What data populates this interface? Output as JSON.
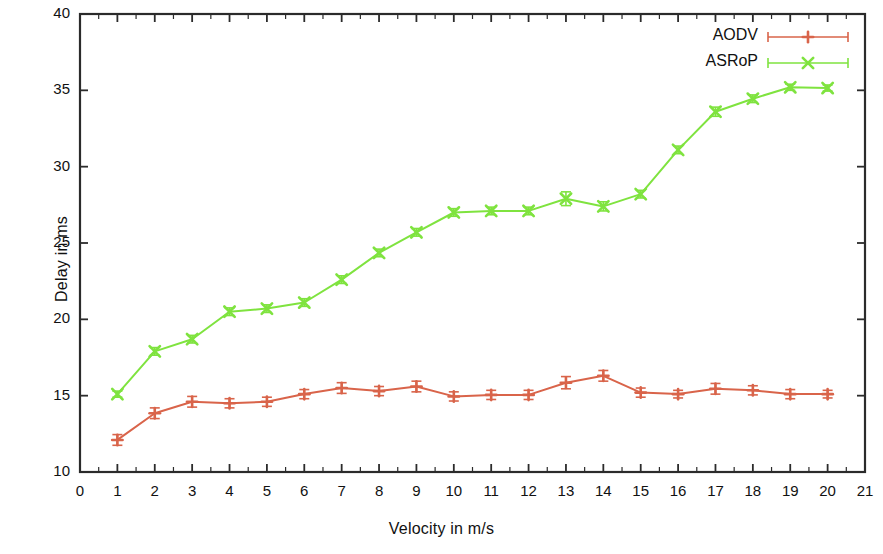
{
  "chart_data": {
    "type": "line",
    "title": "",
    "xlabel": "Velocity in m/s",
    "ylabel": "Delay in ms",
    "xlim": [
      0,
      21
    ],
    "ylim": [
      10,
      40
    ],
    "xticks": [
      0,
      1,
      2,
      3,
      4,
      5,
      6,
      7,
      8,
      9,
      10,
      11,
      12,
      13,
      14,
      15,
      16,
      17,
      18,
      19,
      20,
      21
    ],
    "yticks": [
      10,
      15,
      20,
      25,
      30,
      35,
      40
    ],
    "grid": false,
    "legend_position": "top-right",
    "x": [
      1,
      2,
      3,
      4,
      5,
      6,
      7,
      8,
      9,
      10,
      11,
      12,
      13,
      14,
      15,
      16,
      17,
      18,
      19,
      20
    ],
    "series": [
      {
        "name": "AODV",
        "color": "#d9644a",
        "marker": "plus",
        "values": [
          12.1,
          13.85,
          14.6,
          14.5,
          14.6,
          15.1,
          15.5,
          15.3,
          15.6,
          14.95,
          15.05,
          15.05,
          15.85,
          16.3,
          15.2,
          15.1,
          15.45,
          15.35,
          15.1,
          15.1
        ],
        "errors": [
          0.35,
          0.35,
          0.35,
          0.3,
          0.3,
          0.3,
          0.35,
          0.3,
          0.35,
          0.3,
          0.3,
          0.3,
          0.4,
          0.35,
          0.3,
          0.25,
          0.35,
          0.3,
          0.3,
          0.25
        ]
      },
      {
        "name": "ASRoP",
        "color": "#7fe33f",
        "marker": "cross",
        "values": [
          15.1,
          17.9,
          18.7,
          20.5,
          20.7,
          21.1,
          22.6,
          24.35,
          25.7,
          27.0,
          27.1,
          27.1,
          27.9,
          27.4,
          28.2,
          31.1,
          33.6,
          34.45,
          35.2,
          35.15
        ],
        "errors": [
          0.2,
          0.25,
          0.25,
          0.25,
          0.25,
          0.25,
          0.25,
          0.25,
          0.25,
          0.25,
          0.25,
          0.25,
          0.45,
          0.3,
          0.25,
          0.25,
          0.3,
          0.25,
          0.2,
          0.2
        ]
      }
    ]
  },
  "axes": {
    "x_title": "Velocity in m/s",
    "y_title": "Delay in ms",
    "x_tick_labels": [
      "0",
      "1",
      "2",
      "3",
      "4",
      "5",
      "6",
      "7",
      "8",
      "9",
      "10",
      "11",
      "12",
      "13",
      "14",
      "15",
      "16",
      "17",
      "18",
      "19",
      "20",
      "21"
    ],
    "y_tick_labels": [
      "10",
      "15",
      "20",
      "25",
      "30",
      "35",
      "40"
    ]
  },
  "legend": {
    "entries": [
      {
        "label": "AODV",
        "color": "#d9644a"
      },
      {
        "label": "ASRoP",
        "color": "#7fe33f"
      }
    ]
  },
  "colors": {
    "aodv": "#d9644a",
    "asrop": "#7fe33f",
    "axis": "#2b2b2b",
    "background": "#ffffff"
  }
}
